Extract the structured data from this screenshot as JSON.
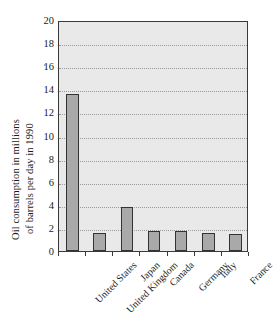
{
  "chart_data": {
    "type": "bar",
    "title": "",
    "xlabel": "",
    "ylabel": "Oil consumption in millions of barrels per day in 1990",
    "ylabel_line1": "Oil consumption in millions",
    "ylabel_line2": "of barrels per day in 1990",
    "categories": [
      "United States",
      "United Kingdom",
      "Japan",
      "Canada",
      "Germany",
      "Italy",
      "France"
    ],
    "values": [
      13.6,
      1.6,
      3.8,
      1.7,
      1.75,
      1.6,
      1.45
    ],
    "ylim": [
      0,
      20
    ],
    "ytick_labels": [
      "0",
      "2",
      "4",
      "6",
      "8",
      "10",
      "12",
      "14",
      "16",
      "18",
      "20"
    ],
    "ytick_values": [
      0,
      2,
      4,
      6,
      8,
      10,
      12,
      14,
      16,
      18,
      20
    ],
    "grid": true,
    "grid_orientation": "horizontal",
    "legend": false,
    "legend_position": "none",
    "bar_color": "#a9a9a9",
    "bar_edge_color": "#333333",
    "plot_background": "#e9e9e9",
    "axis_color": "#3a3a3a",
    "text_color": "#1a1a1a"
  }
}
